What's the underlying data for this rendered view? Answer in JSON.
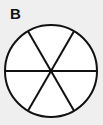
{
  "figure": {
    "label": "B",
    "caption": "",
    "background_color": "#efefef",
    "ink_color": "#111111",
    "fill_color": "#ffffff"
  },
  "diagram": {
    "name": "fraction-circle",
    "shape": "circle",
    "total_parts": 6,
    "shaded_parts": 0,
    "unshaded_parts": 6,
    "fraction_shaded": "0/6",
    "center_x": 51,
    "center_y": 71,
    "radius": 46,
    "stroke_width": 2,
    "divider_count": 3,
    "divider_angles_deg": [
      0,
      60,
      120
    ],
    "sector_angle_deg": 60,
    "sectors": [
      {
        "id": "sector-1",
        "start_deg": 0,
        "end_deg": 60,
        "shaded": false
      },
      {
        "id": "sector-2",
        "start_deg": 60,
        "end_deg": 120,
        "shaded": false
      },
      {
        "id": "sector-3",
        "start_deg": 120,
        "end_deg": 180,
        "shaded": false
      },
      {
        "id": "sector-4",
        "start_deg": 180,
        "end_deg": 240,
        "shaded": false
      },
      {
        "id": "sector-5",
        "start_deg": 240,
        "end_deg": 300,
        "shaded": false
      },
      {
        "id": "sector-6",
        "start_deg": 300,
        "end_deg": 360,
        "shaded": false
      }
    ],
    "center_dot": {
      "present": true,
      "size": 4
    }
  }
}
